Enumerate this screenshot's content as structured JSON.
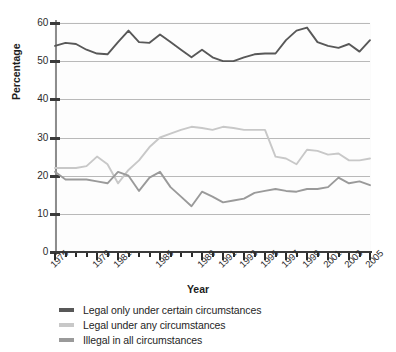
{
  "chart_data": {
    "type": "line",
    "title": "",
    "xlabel": "Year",
    "ylabel": "Percentage",
    "ylim": [
      0,
      60
    ],
    "ytick_values": [
      0,
      10,
      20,
      30,
      40,
      50,
      60
    ],
    "ytick_labels": [
      "0",
      "10",
      "20",
      "30",
      "40",
      "50",
      "60"
    ],
    "xlim": [
      1975,
      2005
    ],
    "xtick_labels": [
      "1975",
      "1979",
      "1981",
      "1985",
      "1989",
      "1991",
      "1993",
      "1995",
      "1997",
      "1999",
      "2001",
      "2003",
      "2005"
    ],
    "xtick_label_years": [
      1975,
      1979,
      1981,
      1985,
      1989,
      1991,
      1993,
      1995,
      1997,
      1999,
      2001,
      2003,
      2005
    ],
    "x": [
      1975,
      1976,
      1977,
      1978,
      1979,
      1980,
      1981,
      1982,
      1983,
      1984,
      1985,
      1986,
      1987,
      1988,
      1989,
      1990,
      1991,
      1992,
      1993,
      1994,
      1995,
      1996,
      1997,
      1998,
      1999,
      2000,
      2001,
      2002,
      2003,
      2004,
      2005
    ],
    "grid": true,
    "legend_position": "below-axes",
    "series": [
      {
        "name": "Legal only under certain circumstances",
        "color": "#585858",
        "values": [
          54.0,
          54.8,
          54.5,
          53.0,
          52.0,
          51.8,
          55.0,
          58.0,
          55.0,
          54.8,
          57.0,
          55.0,
          53.0,
          51.0,
          53.0,
          51.0,
          50.0,
          50.0,
          51.0,
          51.8,
          52.0,
          52.0,
          55.5,
          58.0,
          58.8,
          55.0,
          54.0,
          53.5,
          54.5,
          52.5,
          55.5
        ]
      },
      {
        "name": "Legal under any circumstances",
        "color": "#c8c8c8",
        "values": [
          22.0,
          22.0,
          22.0,
          22.5,
          25.0,
          23.0,
          18.0,
          21.5,
          24.0,
          27.5,
          30.0,
          31.0,
          32.0,
          32.8,
          32.5,
          32.0,
          32.8,
          32.5,
          32.0,
          32.0,
          32.0,
          25.0,
          24.5,
          23.0,
          26.8,
          26.5,
          25.5,
          25.8,
          24.0,
          24.0,
          24.5
        ]
      },
      {
        "name": "Illegal in all circumstances",
        "color": "#9a9a9a",
        "values": [
          21.0,
          19.0,
          19.0,
          19.0,
          18.5,
          18.0,
          21.0,
          20.0,
          16.0,
          19.5,
          21.0,
          17.0,
          14.5,
          12.0,
          15.8,
          14.5,
          13.0,
          13.5,
          14.0,
          15.5,
          16.0,
          16.5,
          16.0,
          15.8,
          16.5,
          16.5,
          17.0,
          19.5,
          18.0,
          18.5,
          17.5
        ]
      }
    ]
  },
  "legend": {
    "items": [
      {
        "label": "Legal only under certain circumstances",
        "color": "#585858"
      },
      {
        "label": "Legal under any circumstances",
        "color": "#c8c8c8"
      },
      {
        "label": "Illegal in all circumstances",
        "color": "#9a9a9a"
      }
    ]
  },
  "axes": {
    "y_title": "Percentage",
    "x_title": "Year"
  }
}
